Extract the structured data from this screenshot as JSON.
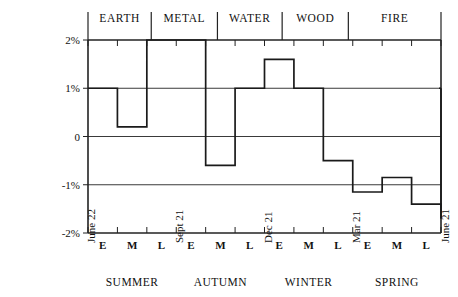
{
  "chart_data": {
    "type": "line",
    "title": "",
    "subtitle": "",
    "xlabel": "",
    "ylabel": "",
    "grid": true,
    "legend_position": "none",
    "step_style": "step-post",
    "ylim": [
      -2,
      2
    ],
    "y_ticks": [
      2,
      1,
      0,
      -1,
      -2
    ],
    "y_tick_labels": [
      "2%",
      "1%",
      "0",
      "-1%",
      "-2%"
    ],
    "x_ticks": [
      "June 22",
      "E",
      "M",
      "L",
      "Sept 21",
      "E",
      "M",
      "L",
      "Dec 21",
      "E",
      "M",
      "L",
      "Mar 21",
      "E",
      "M",
      "L",
      "June 21"
    ],
    "categories": [
      "Summer E",
      "Summer M",
      "Summer L",
      "Autumn E",
      "Autumn M",
      "Autumn L",
      "Winter E",
      "Winter M",
      "Winter L",
      "Spring E",
      "Spring M",
      "Spring L"
    ],
    "values": [
      1.0,
      0.2,
      2.0,
      2.0,
      -0.6,
      1.0,
      1.6,
      1.0,
      -0.5,
      -1.15,
      -0.85,
      -1.4
    ],
    "end_value": -1.7,
    "final_rise_value": 1.0,
    "seasons": [
      "SUMMER",
      "AUTUMN",
      "WINTER",
      "SPRING"
    ],
    "season_boundaries": [
      "June 22",
      "Sept 21",
      "Dec 21",
      "Mar 21",
      "June 21"
    ],
    "phase_labels": [
      "E",
      "M",
      "L"
    ],
    "elements": [
      "EARTH",
      "METAL",
      "WATER",
      "WOOD",
      "FIRE"
    ],
    "element_band_starts": [
      0.0,
      2.15,
      4.4,
      6.6,
      8.85
    ],
    "element_band_ends": [
      2.15,
      4.4,
      6.6,
      8.85,
      12.0
    ]
  },
  "axis": {
    "y_labels": [
      "2%",
      "1%",
      "0",
      "-1%",
      "-2%"
    ]
  },
  "bands": {
    "earth": "EARTH",
    "metal": "METAL",
    "water": "WATER",
    "wood": "WOOD",
    "fire": "FIRE"
  },
  "x_axis": {
    "date_start": "June 22",
    "date_autumn": "Sept 21",
    "date_winter": "Dec 21",
    "date_spring": "Mar 21",
    "date_end": "June 21",
    "phase_e": "E",
    "phase_m": "M",
    "phase_l": "L",
    "season_summer": "SUMMER",
    "season_autumn": "AUTUMN",
    "season_winter": "WINTER",
    "season_spring": "SPRING"
  }
}
